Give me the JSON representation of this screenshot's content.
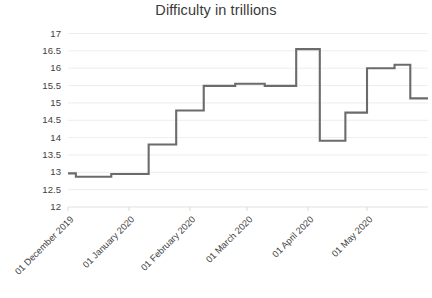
{
  "chart_data": {
    "type": "line",
    "title": "Difficulty in trillions",
    "xlabel": "",
    "ylabel": "",
    "ylim": [
      12,
      17
    ],
    "yticks": [
      12,
      12.5,
      13,
      13.5,
      14,
      14.5,
      15,
      15.5,
      16,
      16.5,
      17
    ],
    "ytick_labels": [
      "12",
      "12.5",
      "13",
      "13.5",
      "14",
      "14.5",
      "15",
      "15.5",
      "16",
      "16.5",
      "17"
    ],
    "grid": true,
    "legend": false,
    "legend_position": "none",
    "line_color": "#6b6b6b",
    "xtick_labels": [
      "01 December 2019",
      "01 January 2020",
      "01 February 2020",
      "01 March 2020",
      "01 April 2020",
      "01 May 2020"
    ],
    "xtick_positions_days": [
      0,
      31,
      62,
      91,
      122,
      152
    ],
    "x_range_days": [
      0,
      183
    ],
    "note": "Bitcoin network difficulty step series, 01 December 2019 to end of May 2020",
    "series": [
      {
        "name": "Difficulty in trillions",
        "step_points_days_value": [
          [
            0,
            12.97
          ],
          [
            4,
            12.97
          ],
          [
            4,
            12.87
          ],
          [
            22,
            12.87
          ],
          [
            22,
            12.95
          ],
          [
            41,
            12.95
          ],
          [
            41,
            13.8
          ],
          [
            55,
            13.8
          ],
          [
            55,
            14.78
          ],
          [
            69,
            14.78
          ],
          [
            69,
            15.49
          ],
          [
            85,
            15.49
          ],
          [
            85,
            15.55
          ],
          [
            100,
            15.55
          ],
          [
            100,
            15.49
          ],
          [
            116,
            15.49
          ],
          [
            116,
            16.55
          ],
          [
            128,
            16.55
          ],
          [
            128,
            13.91
          ],
          [
            141,
            13.91
          ],
          [
            141,
            14.72
          ],
          [
            152,
            14.72
          ],
          [
            152,
            16.0
          ],
          [
            166,
            16.0
          ],
          [
            166,
            16.1
          ],
          [
            174,
            16.1
          ],
          [
            174,
            15.13
          ],
          [
            183,
            15.13
          ]
        ],
        "key_values": [
          12.97,
          12.87,
          12.95,
          13.8,
          14.78,
          15.49,
          15.55,
          15.49,
          16.55,
          13.91,
          14.72,
          16.0,
          16.1,
          15.13
        ]
      }
    ]
  }
}
